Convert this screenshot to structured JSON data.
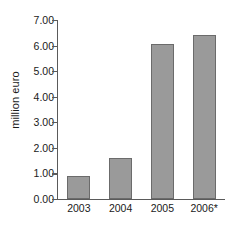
{
  "chart_data": {
    "type": "bar",
    "title": "",
    "subtitle": "",
    "xlabel": "",
    "ylabel": "million euro",
    "categories": [
      "2003",
      "2004",
      "2005",
      "2006*"
    ],
    "values": [
      0.9,
      1.6,
      6.05,
      6.4
    ],
    "series": [
      {
        "name": "million euro",
        "values": [
          0.9,
          1.6,
          6.05,
          6.4
        ]
      }
    ],
    "ylim": [
      0.0,
      7.0
    ],
    "ytick_step": 1.0,
    "ytick_labels": [
      "0.00",
      "1.00",
      "2.00",
      "3.00",
      "4.00",
      "5.00",
      "6.00",
      "7.00"
    ],
    "ytick_values": [
      0,
      1,
      2,
      3,
      4,
      5,
      6,
      7
    ],
    "grid": false,
    "legend": false,
    "legend_position": "none",
    "annotations": [],
    "colors": {
      "bar_fill": "#9a9a9a",
      "bar_border": "#6b6b6b",
      "axis": "#5a5a5a",
      "text": "#1a1a1a",
      "background": "#ffffff"
    }
  }
}
